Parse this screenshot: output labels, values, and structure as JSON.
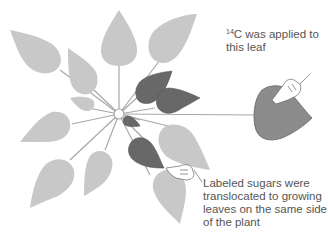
{
  "figure": {
    "type": "phyllotaxis source-sink diagram",
    "colors": {
      "unlabeled_leaf": "#c8c8c8",
      "labeled_leaf": "#686868",
      "source_leaf": "#8c8c8c",
      "stem_line": "#a8a8a8",
      "center": "#ffffff",
      "text": "#555555"
    }
  },
  "annotations": {
    "applied": {
      "isotope_superscript": "14",
      "isotope_symbol": "C",
      "text_line1": " was applied to",
      "text_line2": "this leaf"
    },
    "translocated": {
      "line1": "Labeled sugars were",
      "line2": "translocated to growing",
      "line3": "leaves on the same side",
      "line4": "of the plant"
    }
  }
}
